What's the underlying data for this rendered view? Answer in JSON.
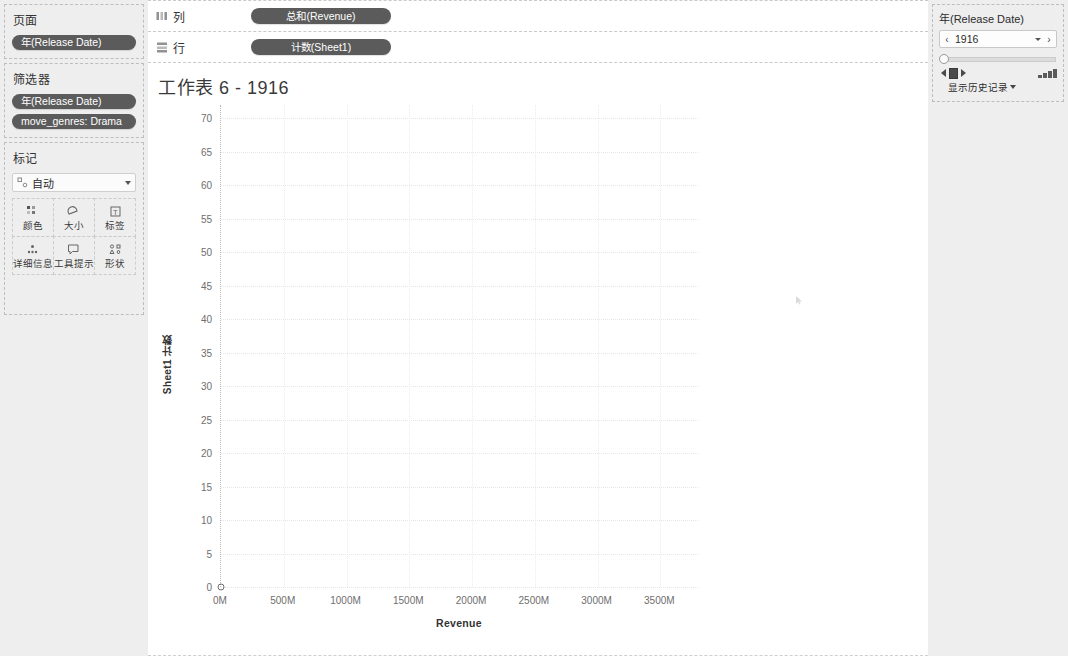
{
  "sidebar": {
    "pages": {
      "title": "页面",
      "pills": [
        {
          "label": "年(Release Date)",
          "name": "pill-year-release-date"
        }
      ]
    },
    "filters": {
      "title": "筛选器",
      "pills": [
        {
          "label": "年(Release Date)",
          "name": "pill-filter-year-release-date"
        },
        {
          "label": "move_genres: Drama",
          "name": "pill-filter-move-genres-drama"
        }
      ]
    },
    "marks": {
      "title": "标记",
      "mark_type": "自动",
      "mark_type_icon": "automatic-icon",
      "buttons": [
        {
          "label": "颜色",
          "icon": "color-icon"
        },
        {
          "label": "大小",
          "icon": "size-icon"
        },
        {
          "label": "标签",
          "icon": "label-icon"
        },
        {
          "label": "详细信息",
          "icon": "detail-icon"
        },
        {
          "label": "工具提示",
          "icon": "tooltip-icon"
        },
        {
          "label": "形状",
          "icon": "shape-icon"
        }
      ]
    }
  },
  "shelves": [
    {
      "name": "列",
      "icon": "columns-icon",
      "pill": "总和(Revenue)"
    },
    {
      "name": "行",
      "icon": "rows-icon",
      "pill": "计数(Sheet1)"
    }
  ],
  "worksheet": {
    "title": "工作表 6 - 1916"
  },
  "pages_card": {
    "title": "年(Release Date)",
    "current_value": "1916",
    "prev_label": "‹",
    "next_label": "›",
    "show_history_label": "显示历史记录"
  },
  "chart_data": {
    "type": "scatter",
    "title": "工作表 6 - 1916",
    "xlabel": "Revenue",
    "ylabel": "Sheet1 计数",
    "xlim": [
      0,
      3800000000
    ],
    "ylim": [
      0,
      72
    ],
    "xticks": [
      0,
      500000000,
      1000000000,
      1500000000,
      2000000000,
      2500000000,
      3000000000,
      3500000000
    ],
    "xticklabels": [
      "0M",
      "500M",
      "1000M",
      "1500M",
      "2000M",
      "2500M",
      "3000M",
      "3500M"
    ],
    "yticks": [
      0,
      5,
      10,
      15,
      20,
      25,
      30,
      35,
      40,
      45,
      50,
      55,
      60,
      65,
      70
    ],
    "yticklabels": [
      "0",
      "5",
      "10",
      "15",
      "20",
      "25",
      "30",
      "35",
      "40",
      "45",
      "50",
      "55",
      "60",
      "65",
      "70"
    ],
    "grid": true,
    "legend": false,
    "points": [
      {
        "x": 0,
        "y": 0,
        "label": ""
      }
    ]
  }
}
